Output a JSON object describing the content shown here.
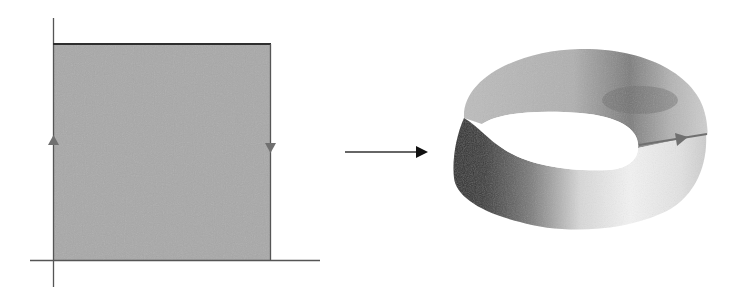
{
  "diagram": {
    "square": {
      "fill": "#a9a9a9",
      "edge_color": "#555555",
      "top_edge_color": "#2e2e2e",
      "left_arrow": "up",
      "right_arrow": "down",
      "arrow_color": "#707070"
    },
    "axes": {
      "color": "#555555"
    },
    "map_arrow": {
      "color": "#111111",
      "direction": "right"
    },
    "mobius_band": {
      "light": "#f2f2f2",
      "mid": "#b8b8b8",
      "dark": "#2f2f2f",
      "core_arrow_color": "#707070"
    }
  }
}
